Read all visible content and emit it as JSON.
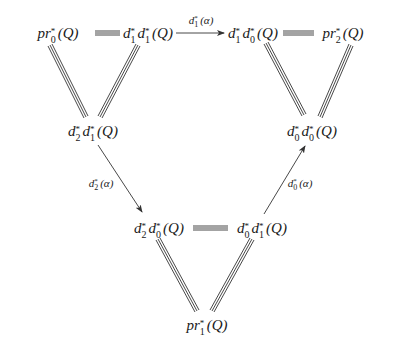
{
  "diagram": {
    "type": "commutative-diagram",
    "nodes": {
      "pr0": {
        "name": "pr",
        "base": "Q",
        "factors": [
          {
            "d": "pr",
            "sub": "0"
          }
        ],
        "text": "pr_0^*(Q)"
      },
      "d1d1": {
        "text": "d_1^*d_1^*(Q)"
      },
      "d1d0": {
        "text": "d_1^*d_0^*(Q)"
      },
      "pr2": {
        "text": "pr_2^*(Q)"
      },
      "d2d1": {
        "text": "d_2^*d_1^*(Q)"
      },
      "d0d0": {
        "text": "d_0^*d_0^*(Q)"
      },
      "d2d0": {
        "text": "d_2^*d_0^*(Q)"
      },
      "d0d1": {
        "text": "d_0^*d_1^*(Q)"
      },
      "pr1": {
        "text": "pr_1^*(Q)"
      }
    },
    "arrows": [
      {
        "from": "d1d1",
        "to": "d1d0",
        "label": "d_1^*(α)",
        "style": "arrow"
      },
      {
        "from": "d2d1",
        "to": "d2d0",
        "label": "d_2^*(α)",
        "style": "arrow"
      },
      {
        "from": "d0d1",
        "to": "d0d0",
        "label": "d_0^*(α)",
        "style": "arrow"
      }
    ],
    "equalities": [
      {
        "from": "pr0",
        "to": "d1d1"
      },
      {
        "from": "pr0",
        "to": "d2d1"
      },
      {
        "from": "d1d1",
        "to": "d2d1"
      },
      {
        "from": "d1d0",
        "to": "pr2"
      },
      {
        "from": "d1d0",
        "to": "d0d0"
      },
      {
        "from": "pr2",
        "to": "d0d0"
      },
      {
        "from": "d2d0",
        "to": "d0d1"
      },
      {
        "from": "d2d0",
        "to": "pr1"
      },
      {
        "from": "d0d1",
        "to": "pr1"
      }
    ],
    "labels": {
      "arrow_top": {
        "f": "d",
        "sub": "1",
        "sup": "*",
        "arg": "(α)"
      },
      "arrow_left": {
        "f": "d",
        "sub": "2",
        "sup": "*",
        "arg": "(α)"
      },
      "arrow_right": {
        "f": "d",
        "sub": "0",
        "sup": "*",
        "arg": "(α)"
      }
    }
  },
  "render": {
    "pr0": {
      "p1": "pr",
      "s1": "*",
      "b1": "0",
      "tail": "(Q)"
    },
    "d1d1": {
      "p1": "d",
      "s1": "*",
      "b1": "1",
      "p2": "d",
      "s2": "*",
      "b2": "1",
      "tail": "(Q)"
    },
    "d1d0": {
      "p1": "d",
      "s1": "*",
      "b1": "1",
      "p2": "d",
      "s2": "*",
      "b2": "0",
      "tail": "(Q)"
    },
    "pr2": {
      "p1": "pr",
      "s1": "*",
      "b1": "2",
      "tail": "(Q)"
    },
    "d2d1": {
      "p1": "d",
      "s1": "*",
      "b1": "2",
      "p2": "d",
      "s2": "*",
      "b2": "1",
      "tail": "(Q)"
    },
    "d0d0": {
      "p1": "d",
      "s1": "*",
      "b1": "0",
      "p2": "d",
      "s2": "*",
      "b2": "0",
      "tail": "(Q)"
    },
    "d2d0": {
      "p1": "d",
      "s1": "*",
      "b1": "2",
      "p2": "d",
      "s2": "*",
      "b2": "0",
      "tail": "(Q)"
    },
    "d0d1": {
      "p1": "d",
      "s1": "*",
      "b1": "0",
      "p2": "d",
      "s2": "*",
      "b2": "1",
      "tail": "(Q)"
    },
    "pr1": {
      "p1": "pr",
      "s1": "*",
      "b1": "1",
      "tail": "(Q)"
    },
    "lab_top": {
      "p1": "d",
      "s1": "*",
      "b1": "1",
      "tail": "(α)"
    },
    "lab_left": {
      "p1": "d",
      "s1": "*",
      "b1": "2",
      "tail": "(α)"
    },
    "lab_right": {
      "p1": "d",
      "s1": "*",
      "b1": "0",
      "tail": "(α)"
    }
  }
}
